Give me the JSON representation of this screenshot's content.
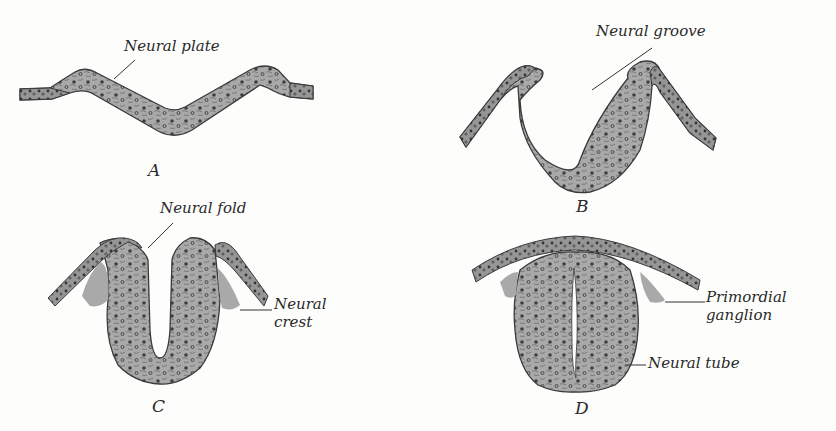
{
  "figure": {
    "colors": {
      "background": "#fdfdfc",
      "tissue_fill": "#a8a8a8",
      "tissue_outline": "#3a3a3a",
      "ectoderm_fill": "#8e8e8e",
      "nuclei": "#3c3c3c",
      "text": "#2a2a2a"
    },
    "panels": [
      {
        "id": "A",
        "letter": "A",
        "labels": [
          {
            "text": "Neural plate"
          }
        ]
      },
      {
        "id": "B",
        "letter": "B",
        "labels": [
          {
            "text": "Neural groove"
          }
        ]
      },
      {
        "id": "C",
        "letter": "C",
        "labels": [
          {
            "text": "Neural fold"
          },
          {
            "text": "Neural"
          },
          {
            "text": "crest"
          }
        ]
      },
      {
        "id": "D",
        "letter": "D",
        "labels": [
          {
            "text": "Primordial"
          },
          {
            "text": "ganglion"
          },
          {
            "text": "Neural tube"
          }
        ]
      }
    ]
  }
}
